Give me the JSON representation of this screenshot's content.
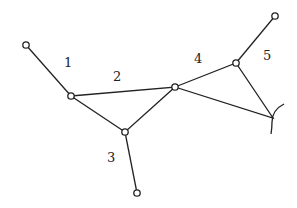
{
  "diagram": {
    "type": "hypergraph",
    "colors": {
      "stroke": "#222222",
      "background": "#ffffff",
      "node_fill": "#ffffff"
    },
    "nodes": [
      {
        "id": "A",
        "x": 26,
        "y": 45
      },
      {
        "id": "B",
        "x": 71,
        "y": 96
      },
      {
        "id": "C",
        "x": 125,
        "y": 132
      },
      {
        "id": "D",
        "x": 137,
        "y": 193
      },
      {
        "id": "E",
        "x": 175,
        "y": 87
      },
      {
        "id": "F",
        "x": 236,
        "y": 63
      },
      {
        "id": "G",
        "x": 275,
        "y": 16
      }
    ],
    "edges": [
      {
        "id": "1",
        "label": "1",
        "kind": "line",
        "from": "A",
        "to": "B"
      },
      {
        "id": "2",
        "label": "2",
        "kind": "hatched-triangle",
        "vertices": [
          "B",
          "E",
          "C"
        ]
      },
      {
        "id": "3",
        "label": "3",
        "kind": "line",
        "from": "C",
        "to": "D"
      },
      {
        "id": "4",
        "label": "4",
        "kind": "hatched-triangle",
        "vertices": [
          "E",
          "F",
          "H"
        ]
      },
      {
        "id": "5",
        "label": "5",
        "kind": "line",
        "from": "F",
        "to": "G"
      }
    ],
    "labels": [
      {
        "text": "1",
        "x": 64,
        "y": 67
      },
      {
        "text": "2",
        "x": 113,
        "y": 81
      },
      {
        "text": "3",
        "x": 107,
        "y": 162
      },
      {
        "text": "4",
        "x": 194,
        "y": 63
      },
      {
        "text": "5",
        "x": 263,
        "y": 60
      }
    ],
    "open_end": {
      "id": "H",
      "x": 273,
      "y": 118,
      "glyph": "arc"
    }
  }
}
